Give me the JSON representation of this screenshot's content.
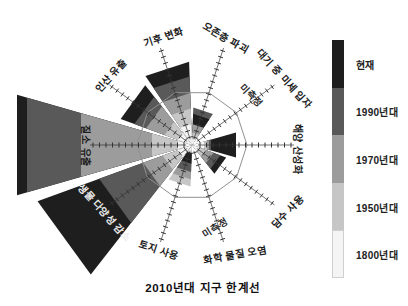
{
  "caption": "2010년대 지구 한계선",
  "colors": {
    "background": "#ffffff",
    "era_present": "#1e1e1e",
    "era_1990s": "#595959",
    "era_1970s": "#9c9c9c",
    "era_1950s": "#c6c6c6",
    "era_1800s": "#f4f4f4",
    "era_1800s_border": "#d0d0d0",
    "boundary_polygon_stroke": "#909090",
    "axis_tick": "#333333",
    "label_text": "#1c1c1c",
    "label_text_on_dark": "#ececec"
  },
  "legend": {
    "bar": {
      "x": 332,
      "y": 40,
      "width": 12,
      "segment_height": 47.6
    },
    "label_x": 356,
    "items": [
      {
        "label": "현재",
        "era": "present"
      },
      {
        "label": "1990년대",
        "era": "1990s"
      },
      {
        "label": "1970년대",
        "era": "1970s"
      },
      {
        "label": "1950년대",
        "era": "1950s"
      },
      {
        "label": "1800년대",
        "era": "1800s"
      }
    ]
  },
  "chart_data": {
    "type": "polar-rose",
    "title": "2010년대 지구 한계선",
    "legend_entries": [
      "현재",
      "1990년대",
      "1970년대",
      "1950년대",
      "1800년대"
    ],
    "era_keys": [
      "1800s",
      "1950s",
      "1970s",
      "1990s",
      "present"
    ],
    "center": {
      "x": 192,
      "y": 145
    },
    "boundary_radius_px": 55,
    "sector_half_angle_deg": 16,
    "axis": {
      "inner_r": 6,
      "outer_r": 102,
      "tick_spacing_px": 6.5,
      "tick_len_px": 5
    },
    "grid": "decagon boundary polygon at radius 55px = planetary limit",
    "sectors": [
      {
        "label": "기후 변화",
        "angle_deg": 108,
        "measured": true,
        "radii_px": {
          "1800s": 20,
          "1950s": 35,
          "1970s": 50,
          "1990s": 66,
          "present": 80
        },
        "values_vs_boundary": {
          "1800s": 0.36,
          "1950s": 0.64,
          "1970s": 0.91,
          "1990s": 1.2,
          "present": 1.45
        },
        "label_pos": {
          "x": 163,
          "y": 36,
          "rot": -18
        }
      },
      {
        "label": "오존층 파괴",
        "angle_deg": 72,
        "measured": true,
        "radii_px": {
          "1800s": 6,
          "1950s": 12,
          "1970s": 20,
          "1990s": 36,
          "present": 30
        },
        "values_vs_boundary": {
          "1800s": 0.11,
          "1950s": 0.22,
          "1970s": 0.36,
          "1990s": 0.65,
          "present": 0.55
        },
        "label_pos": {
          "x": 226,
          "y": 37,
          "rot": 30
        }
      },
      {
        "label": "대기 중 미세 입자",
        "angle_deg": 36,
        "measured": false,
        "radii_px": null,
        "values_vs_boundary": null,
        "label_pos": {
          "x": 285,
          "y": 78,
          "rot": 48
        }
      },
      {
        "label": "해양 산성화",
        "angle_deg": 0,
        "measured": true,
        "radii_px": {
          "1800s": 12,
          "1950s": 15,
          "1970s": 17,
          "1990s": 19,
          "present": 44
        },
        "values_vs_boundary": {
          "1800s": 0.22,
          "1950s": 0.27,
          "1970s": 0.31,
          "1990s": 0.35,
          "present": 0.8
        },
        "label_pos": {
          "x": 298,
          "y": 149,
          "rot": 90
        }
      },
      {
        "label": "담수 사용",
        "angle_deg": -36,
        "measured": true,
        "radii_px": {
          "1800s": 8,
          "1950s": 14,
          "1970s": 22,
          "1990s": 29,
          "present": 35
        },
        "values_vs_boundary": {
          "1800s": 0.15,
          "1950s": 0.25,
          "1970s": 0.4,
          "1990s": 0.53,
          "present": 0.64
        },
        "label_pos": {
          "x": 287,
          "y": 211,
          "rot": -45
        }
      },
      {
        "label": "화학 물질 오염",
        "angle_deg": -72,
        "measured": false,
        "radii_px": null,
        "values_vs_boundary": null,
        "label_pos": {
          "x": 235,
          "y": 254,
          "rot": -10
        }
      },
      {
        "label": "토지 사용",
        "angle_deg": -108,
        "measured": true,
        "radii_px": {
          "1800s": 8,
          "1950s": 40,
          "1970s": 33,
          "1990s": 26,
          "present": 18
        },
        "values_vs_boundary": {
          "1800s": 0.15,
          "1950s": 0.73,
          "1970s": 0.6,
          "1990s": 0.47,
          "present": 0.33
        },
        "label_pos": {
          "x": 159,
          "y": 249,
          "rot": 18
        }
      },
      {
        "label": "생물 다양성 감소",
        "angle_deg": -144,
        "measured": true,
        "radii_px": {
          "1800s": 15,
          "1950s": 30,
          "1970s": 50,
          "1990s": 95,
          "present": 158
        },
        "values_vs_boundary": {
          "1800s": 0.27,
          "1950s": 0.55,
          "1970s": 0.91,
          "1990s": 1.73,
          "present": 2.87
        },
        "label_pos": {
          "x": 105,
          "y": 212,
          "rot": 48
        },
        "label_on_dark": true
      },
      {
        "label": "질소 유출",
        "angle_deg": 180,
        "measured": true,
        "radii_px": {
          "1800s": 14,
          "1950s": 40,
          "1970s": 111,
          "1990s": 165,
          "present": 175
        },
        "values_vs_boundary": {
          "1800s": 0.25,
          "1950s": 0.73,
          "1970s": 2.02,
          "1990s": 3.0,
          "present": 3.18
        },
        "label_pos": {
          "x": 86,
          "y": 146,
          "rot": 90
        }
      },
      {
        "label": "인산 유출",
        "angle_deg": 144,
        "measured": true,
        "radii_px": {
          "1800s": 15,
          "1950s": 28,
          "1970s": 47,
          "1990s": 59,
          "present": 73
        },
        "values_vs_boundary": {
          "1800s": 0.27,
          "1950s": 0.51,
          "1970s": 0.85,
          "1990s": 1.07,
          "present": 1.33
        },
        "label_pos": {
          "x": 110,
          "y": 75,
          "rot": -48
        }
      }
    ],
    "annotations": [
      {
        "text": "미측정",
        "x": 252,
        "y": 95,
        "rot": 46
      },
      {
        "text": "미측정",
        "x": 215,
        "y": 227,
        "rot": -32
      }
    ]
  }
}
